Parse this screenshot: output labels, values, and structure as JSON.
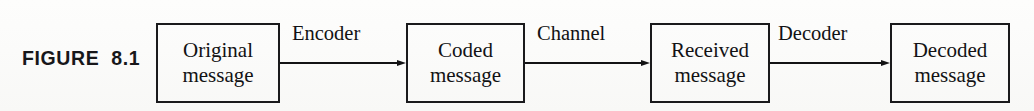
{
  "figure": {
    "label": "FIGURE  8.1",
    "caption_number": "8.1",
    "background_color": "#fdfdfc",
    "ink_color": "#131315"
  },
  "diagram": {
    "type": "block-diagram",
    "orientation": "left-to-right",
    "nodes": [
      {
        "id": "original",
        "line1": "Original",
        "line2": "message",
        "x": 156,
        "width": 124
      },
      {
        "id": "coded",
        "line1": "Coded",
        "line2": "message",
        "x": 406,
        "width": 119
      },
      {
        "id": "received",
        "line1": "Received",
        "line2": "message",
        "x": 650,
        "width": 120
      },
      {
        "id": "decoded",
        "line1": "Decoded",
        "line2": "message",
        "x": 890,
        "width": 120
      }
    ],
    "edges": [
      {
        "id": "encoder",
        "label": "Encoder",
        "from": "original",
        "to": "coded",
        "x": 280,
        "width": 126,
        "label_x": 292
      },
      {
        "id": "channel",
        "label": "Channel",
        "from": "coded",
        "to": "received",
        "x": 525,
        "width": 125,
        "label_x": 537
      },
      {
        "id": "decoder",
        "label": "Decoder",
        "from": "received",
        "to": "decoded",
        "x": 770,
        "width": 120,
        "label_x": 778
      }
    ]
  }
}
